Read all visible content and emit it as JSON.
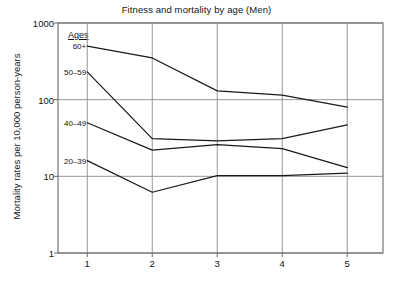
{
  "chart_data": {
    "type": "line",
    "title": "Fitness and mortality by age (Men)",
    "xlabel": "",
    "ylabel": "Mortality rates per 10,000 person-years",
    "yscale": "log",
    "ylim": [
      1,
      1000
    ],
    "ytick_labels": [
      "1000",
      "100",
      "10",
      "1"
    ],
    "ytick_values": [
      1000,
      100,
      10,
      1
    ],
    "x": [
      1,
      2,
      3,
      4,
      5
    ],
    "xtick_labels": [
      "1",
      "2",
      "3",
      "4",
      "5"
    ],
    "xlim": [
      0.55,
      5.55
    ],
    "grid": true,
    "legend_position": "inline-left",
    "legend_heading": "Ages",
    "series": [
      {
        "name": "60+",
        "values": [
          500,
          350,
          130,
          115,
          80
        ]
      },
      {
        "name": "50–59",
        "values": [
          230,
          31,
          29,
          31,
          47
        ]
      },
      {
        "name": "40–49",
        "values": [
          50,
          22,
          26,
          23,
          13
        ]
      },
      {
        "name": "20–39",
        "values": [
          16,
          6.2,
          10.2,
          10.2,
          11
        ]
      }
    ]
  },
  "axis": {
    "y_title": "Mortality rates per 10,000 person-years",
    "ticks_y": [
      {
        "label": "1000",
        "value": 1000
      },
      {
        "label": "100",
        "value": 100
      },
      {
        "label": "10",
        "value": 10
      },
      {
        "label": "1",
        "value": 1
      }
    ],
    "ticks_x": [
      {
        "label": "1",
        "value": 1
      },
      {
        "label": "2",
        "value": 2
      },
      {
        "label": "3",
        "value": 3
      },
      {
        "label": "4",
        "value": 4
      },
      {
        "label": "5",
        "value": 5
      }
    ]
  },
  "legend": {
    "heading": "Ages",
    "items": [
      {
        "label": "60+"
      },
      {
        "label": "50–59"
      },
      {
        "label": "40–49"
      },
      {
        "label": "20–39"
      }
    ]
  },
  "style": {
    "line_color": "#1a1a1a",
    "grid_color": "#8c8c8c",
    "axis_color": "#6b6b6b",
    "text_color": "#141414",
    "background": "#ffffff"
  }
}
